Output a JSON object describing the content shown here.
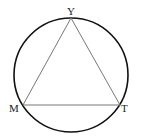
{
  "diagram": {
    "type": "inscribed-triangle",
    "circle": {
      "cx": 71,
      "cy": 75,
      "r": 57,
      "stroke": "#111111"
    },
    "triangle_stroke": "#777777",
    "points": {
      "Y": {
        "label": "Y",
        "x": 71,
        "y": 18
      },
      "M": {
        "label": "M",
        "x": 23,
        "y": 105
      },
      "T": {
        "label": "T",
        "x": 120,
        "y": 105
      }
    }
  }
}
